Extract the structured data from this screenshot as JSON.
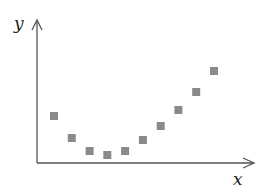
{
  "chart_data": {
    "type": "scatter",
    "title": "",
    "xlabel": "x",
    "ylabel": "y",
    "grid": false,
    "legend": null,
    "ticks": "none",
    "marker": "square",
    "marker_color": "#8a8a8a",
    "x": [
      1,
      2,
      3,
      4,
      5,
      6,
      7,
      8,
      9,
      10
    ],
    "y": [
      47,
      25,
      12,
      8,
      12,
      23,
      37,
      53,
      71,
      92
    ],
    "xlim": [
      0,
      12
    ],
    "ylim": [
      0,
      143
    ],
    "note": "y values are relative heights above the x-axis (no numeric ticks shown); shape is U/parabolic with minimum near x=4"
  },
  "labels": {
    "x_axis": "x",
    "y_axis": "y"
  }
}
